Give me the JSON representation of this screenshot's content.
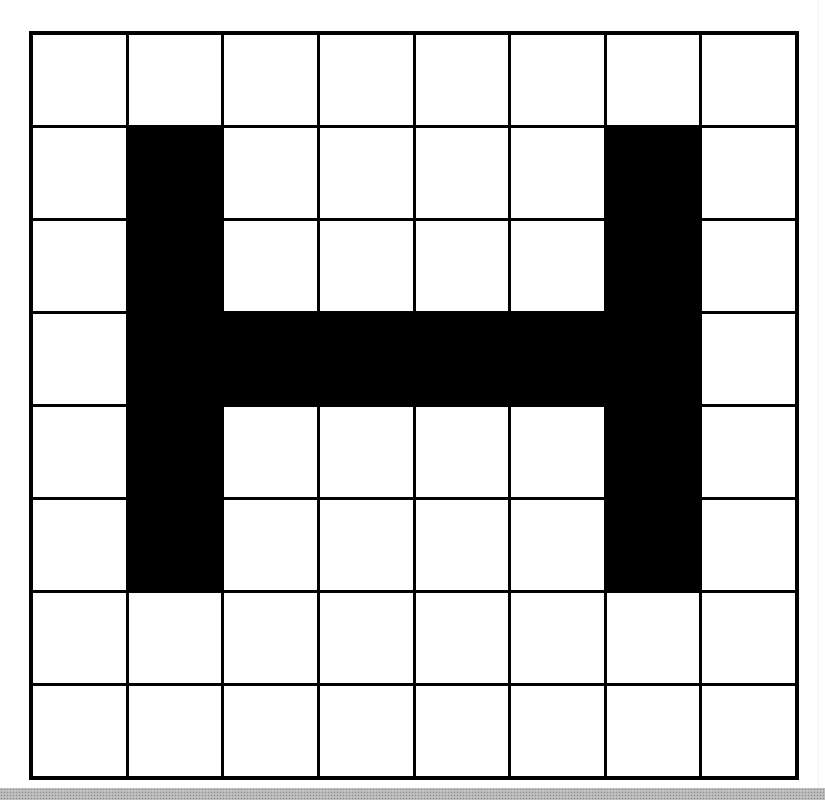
{
  "diagram": {
    "letter": "H",
    "rows": 8,
    "cols": 8,
    "colors": {
      "filled": "#000000",
      "empty": "#ffffff",
      "grid_line": "#000000",
      "bottom_band": "#b8b8b8"
    },
    "cells": [
      [
        0,
        0,
        0,
        0,
        0,
        0,
        0,
        0
      ],
      [
        0,
        1,
        0,
        0,
        0,
        0,
        1,
        0
      ],
      [
        0,
        1,
        0,
        0,
        0,
        0,
        1,
        0
      ],
      [
        0,
        1,
        1,
        1,
        1,
        1,
        1,
        0
      ],
      [
        0,
        1,
        0,
        0,
        0,
        0,
        1,
        0
      ],
      [
        0,
        1,
        0,
        0,
        0,
        0,
        1,
        0
      ],
      [
        0,
        0,
        0,
        0,
        0,
        0,
        0,
        0
      ],
      [
        0,
        0,
        0,
        0,
        0,
        0,
        0,
        0
      ]
    ]
  }
}
